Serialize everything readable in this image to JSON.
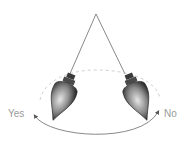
{
  "diagram": {
    "labels": {
      "left": "Yes",
      "right": "No"
    },
    "colors": {
      "string": "#6a6a6a",
      "arc": "#7a7a7a",
      "label": "#9a9a9a",
      "pendulum_dark": "#2e2e2e",
      "pendulum_light": "#d8d8d8"
    }
  }
}
